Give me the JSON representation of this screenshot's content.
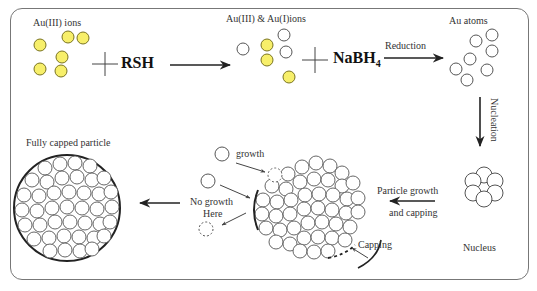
{
  "diagram": {
    "colors": {
      "ion_fill": "#f7ef6a",
      "ion_stroke": "#7a7420",
      "atom_stroke": "#555555",
      "line": "#222222"
    },
    "stages": {
      "au3_ions": {
        "label": "Au(III) ions"
      },
      "reagent1": {
        "plus": "+",
        "label": "RSH"
      },
      "mixed_ions": {
        "label": "Au(III) & Au(I)ions"
      },
      "reagent2": {
        "plus": "+",
        "label": "NaBH",
        "subscript": "4"
      },
      "reduction": {
        "label": "Reduction"
      },
      "au_atoms": {
        "label": "Au atoms"
      },
      "nucleation": {
        "label": "Nucleation"
      },
      "nucleus": {
        "label": "Nucleus"
      },
      "particle_growth": {
        "line1": "Particle growth",
        "line2": "and capping"
      },
      "growth": {
        "label": "growth"
      },
      "no_growth": {
        "line1": "No growth",
        "line2": "Here"
      },
      "capping": {
        "label": "Capping"
      },
      "fully_capped": {
        "label": "Fully capped particle"
      }
    }
  }
}
